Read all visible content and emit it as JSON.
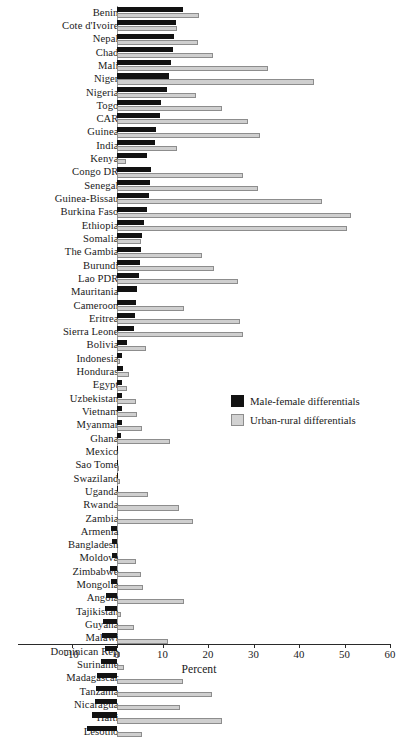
{
  "chart_data": {
    "type": "bar",
    "orientation": "horizontal",
    "title": "",
    "xlabel": "Percent",
    "ylabel": "",
    "xlim": [
      -10,
      60
    ],
    "xticks": [
      -10,
      0,
      10,
      20,
      30,
      40,
      50,
      60
    ],
    "xtick_labels": [
      "-10",
      "0",
      "10",
      "20",
      "30",
      "40",
      "50",
      "60"
    ],
    "grid": false,
    "legend_position": "center-right",
    "categories": [
      "Benin",
      "Cote d'Ivoire",
      "Nepal",
      "Chad",
      "Mali",
      "Niger",
      "Nigeria",
      "Togo",
      "CAR",
      "Guinea",
      "India",
      "Kenya",
      "Congo DR",
      "Senegal",
      "Guinea-Bissau",
      "Burkina Faso",
      "Ethiopia",
      "Somalia",
      "The Gambia",
      "Burundi",
      "Lao PDR",
      "Mauritania",
      "Cameroon",
      "Eritrea",
      "Sierra Leone",
      "Bolivia",
      "Indonesia",
      "Honduras",
      "Egypt",
      "Uzbekistan",
      "Vietnam",
      "Myanmar",
      "Ghana",
      "Mexico",
      "Sao Tome",
      "Swaziland",
      "Uganda",
      "Rwanda",
      "Zambia",
      "Armenia",
      "Bangladesh",
      "Moldova",
      "Zimbabwe",
      "Mongolia",
      "Angola",
      "Tajikistan",
      "Guyana",
      "Malawi",
      "Dominican Rep",
      "Suriname",
      "Madagascar",
      "Tanzania",
      "Nicaragua",
      "Haiti",
      "Lesotho"
    ],
    "series": [
      {
        "name": "Male-female differentials",
        "color": "#121212",
        "values": [
          14.6,
          13.0,
          12.6,
          12.2,
          11.8,
          11.4,
          11.0,
          9.6,
          9.4,
          8.6,
          8.4,
          6.6,
          7.4,
          7.2,
          7.0,
          6.6,
          6.0,
          5.6,
          5.2,
          5.0,
          4.8,
          4.4,
          4.2,
          4.0,
          3.8,
          2.2,
          1.0,
          1.4,
          1.2,
          1.2,
          1.0,
          1.0,
          0.8,
          0.2,
          0.2,
          0.1,
          0.1,
          0.0,
          0.0,
          -1.4,
          -1.0,
          -1.2,
          -1.6,
          -1.4,
          -2.4,
          -2.6,
          -3.0,
          -3.4,
          -2.6,
          -3.6,
          -4.4,
          -4.6,
          -4.8,
          -5.4,
          -6.6
        ]
      },
      {
        "name": "Urban-rural differentials",
        "color": "#cfcfcf",
        "values": [
          18.0,
          13.2,
          17.8,
          21.0,
          33.2,
          43.2,
          17.4,
          23.0,
          28.8,
          31.4,
          13.2,
          2.0,
          27.8,
          31.0,
          45.0,
          51.4,
          50.6,
          5.2,
          18.6,
          21.4,
          26.6,
          0.0,
          14.8,
          27.0,
          27.6,
          6.4,
          0.6,
          2.6,
          2.2,
          4.2,
          4.4,
          5.4,
          11.6,
          0.0,
          0.4,
          0.6,
          6.8,
          13.6,
          16.6,
          0.0,
          0.0,
          4.2,
          5.2,
          5.8,
          14.8,
          0.8,
          3.8,
          11.2,
          0.6,
          1.6,
          14.4,
          20.8,
          13.8,
          23.0,
          5.4
        ]
      }
    ]
  },
  "legend": {
    "items": [
      {
        "label": "Male-female differentials",
        "swatch": "black"
      },
      {
        "label": "Urban-rural differentials",
        "swatch": "grey"
      }
    ]
  }
}
